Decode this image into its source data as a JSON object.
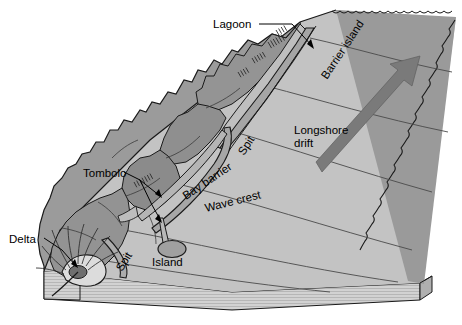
{
  "figure": {
    "type": "block-diagram",
    "width": 462,
    "height": 325,
    "background_color": "#ffffff"
  },
  "palette": {
    "land": "#9b9b9b",
    "land_dark": "#8a8a8a",
    "land_light": "#a8a8a8",
    "water": "#c3c3c3",
    "water_deep": "#b4b4b4",
    "deep_edge": "#8c8c8c",
    "base_side": "#c9c9c9",
    "base_front": "#d2d2d2",
    "delta_fan": "#dcdcdc",
    "island": "#a0a0a0",
    "arrow": "#7a7a7a",
    "outline": "#1a1a1a",
    "label_text": "#000000"
  },
  "labels": {
    "lagoon": "Lagoon",
    "barrier_island": "Barrier island",
    "longshore_drift_line1": "Longshore",
    "longshore_drift_line2": "drift",
    "spit_upper": "Spit",
    "bay_barrier": "Bay barrier",
    "wave_crest": "Wave crest",
    "tombolo": "Tombolo",
    "island": "Island",
    "spit_lower": "Spit",
    "delta": "Delta"
  },
  "annotations": [
    {
      "name": "lagoon",
      "text": "Lagoon",
      "x": 213,
      "y": 28,
      "leader": true,
      "arrow": true,
      "rotation": 0
    },
    {
      "name": "barrier-island",
      "text": "Barrier island",
      "x": 327,
      "y": 80,
      "leader": false,
      "arrow": false,
      "rotation": -57
    },
    {
      "name": "longshore-drift",
      "text": "Longshore drift",
      "x": 295,
      "y": 130,
      "leader": false,
      "arrow": false,
      "rotation": 0
    },
    {
      "name": "spit-upper",
      "text": "Spit",
      "x": 250,
      "y": 150,
      "leader": false,
      "arrow": false,
      "rotation": -57
    },
    {
      "name": "bay-barrier",
      "text": "Bay barrier",
      "x": 190,
      "y": 190,
      "leader": false,
      "arrow": false,
      "rotation": -32
    },
    {
      "name": "wave-crest",
      "text": "Wave crest",
      "x": 205,
      "y": 210,
      "leader": false,
      "arrow": false,
      "rotation": -16
    },
    {
      "name": "tombolo",
      "text": "Tombolo",
      "x": 86,
      "y": 177,
      "leader": true,
      "arrow": true,
      "rotation": 0
    },
    {
      "name": "island",
      "text": "Island",
      "x": 157,
      "y": 262,
      "leader": false,
      "arrow": false,
      "rotation": 0
    },
    {
      "name": "spit-lower",
      "text": "Spit",
      "x": 124,
      "y": 262,
      "leader": false,
      "arrow": false,
      "rotation": -58
    },
    {
      "name": "delta",
      "text": "Delta",
      "x": 16,
      "y": 243,
      "leader": true,
      "arrow": true,
      "rotation": 0
    }
  ],
  "features": {
    "longshore_drift_arrow": {
      "direction": "up-right",
      "color": "#7a7a7a"
    },
    "island_shape": "ellipse",
    "delta_shape": "fan",
    "shoreline_style": "scalloped"
  }
}
